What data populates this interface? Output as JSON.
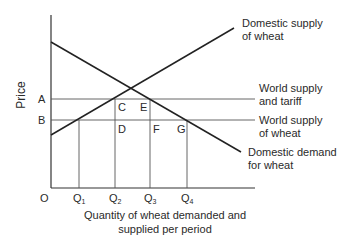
{
  "diagram": {
    "y_axis_label": "Price",
    "x_axis_label_line1": "Quantity of wheat demanded and",
    "x_axis_label_line2": "supplied per period",
    "origin_label": "O",
    "price_levels": {
      "A": "A",
      "B": "B"
    },
    "quantities": [
      {
        "base": "Q",
        "sub": "1"
      },
      {
        "base": "Q",
        "sub": "2"
      },
      {
        "base": "Q",
        "sub": "3"
      },
      {
        "base": "Q",
        "sub": "4"
      }
    ],
    "points": {
      "C": "C",
      "D": "D",
      "E": "E",
      "F": "F",
      "G": "G"
    },
    "curves": {
      "domestic_supply_line1": "Domestic supply",
      "domestic_supply_line2": "of wheat",
      "world_tariff_line1": "World supply",
      "world_tariff_line2": "and tariff",
      "world_supply_line1": "World supply",
      "world_supply_line2": "of wheat",
      "domestic_demand_line1": "Domestic demand",
      "domestic_demand_line2": "for wheat"
    },
    "line_color": "#2a2a2a",
    "thin_line_color": "#555555"
  }
}
